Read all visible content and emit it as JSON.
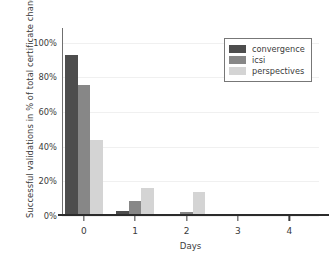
{
  "chart_data": {
    "type": "bar",
    "title": "",
    "xlabel": "Days",
    "ylabel": "Successful validations in % of total certificate changes",
    "categories": [
      "0",
      "1",
      "2",
      "3",
      "4"
    ],
    "ylim": [
      0,
      105
    ],
    "ytick_labels": [
      "0%",
      "20%",
      "40%",
      "60%",
      "80%",
      "100%"
    ],
    "ytick_values": [
      0,
      20,
      40,
      60,
      80,
      100
    ],
    "grid": true,
    "legend_position": "upper right",
    "series": [
      {
        "name": "convergence",
        "color": "#4d4d4d",
        "values": [
          93,
          3,
          0,
          0,
          0
        ]
      },
      {
        "name": "icsi",
        "color": "#878787",
        "values": [
          75.5,
          8.5,
          2.5,
          1,
          1
        ]
      },
      {
        "name": "perspectives",
        "color": "#d4d4d4",
        "values": [
          44,
          16,
          14,
          0.8,
          0
        ]
      }
    ]
  },
  "legend": {
    "items": [
      {
        "label": "convergence",
        "color": "#4d4d4d"
      },
      {
        "label": "icsi",
        "color": "#878787"
      },
      {
        "label": "perspectives",
        "color": "#d4d4d4"
      }
    ]
  }
}
